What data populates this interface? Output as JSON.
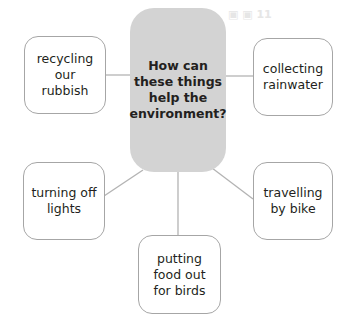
{
  "diagram": {
    "type": "mind-map",
    "central_question": {
      "lines": [
        "How can",
        "these things",
        "help the",
        "environment?"
      ],
      "fill_color": "#d3d3d3"
    },
    "nodes": [
      {
        "id": "recycling",
        "lines": [
          "recycling",
          "our",
          "rubbish"
        ],
        "position": "top-left"
      },
      {
        "id": "rainwater",
        "lines": [
          "collecting",
          "rainwater"
        ],
        "position": "top-right"
      },
      {
        "id": "lights",
        "lines": [
          "turning off",
          "lights"
        ],
        "position": "bottom-left"
      },
      {
        "id": "bike",
        "lines": [
          "travelling",
          "by bike"
        ],
        "position": "bottom-right"
      },
      {
        "id": "birds",
        "lines": [
          "putting",
          "food out",
          "for birds"
        ],
        "position": "bottom"
      }
    ],
    "border_color": "#a6a6a6",
    "connector_color": "#b3b3b3"
  }
}
